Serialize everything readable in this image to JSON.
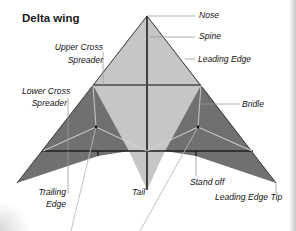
{
  "title": "Delta wing",
  "labels": {
    "nose": "Nose",
    "spine": "Spine",
    "leading_edge": "Leading Edge",
    "upper_cross_spreader_1": "Upper Cross",
    "upper_cross_spreader_2": "Spreader",
    "lower_cross_spreader_1": "Lower Cross",
    "lower_cross_spreader_2": "Spreader",
    "bridle": "Bridle",
    "trailing_edge_1": "Trailing",
    "trailing_edge_2": "Edge",
    "tail": "Tail",
    "stand_off": "Stand off",
    "leading_edge_tip": "Leading Edge Tip"
  },
  "colors": {
    "sail_light": "#c4c4c4",
    "sail_dark": "#6f6f6f",
    "frame": "#2a2a2a",
    "bridle_line": "#d9d9d9",
    "leader_line": "#9a9a9a"
  }
}
